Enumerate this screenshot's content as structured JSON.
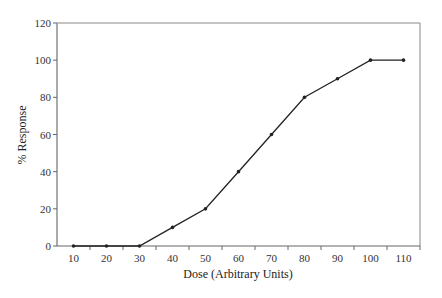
{
  "chart_data": {
    "type": "line",
    "title": "",
    "xlabel": "Dose (Arbitrary Units)",
    "ylabel": "% Response",
    "x": [
      10,
      20,
      30,
      40,
      50,
      60,
      70,
      80,
      90,
      100,
      110
    ],
    "series": [
      {
        "name": "Response",
        "values": [
          0,
          0,
          0,
          10,
          20,
          40,
          60,
          80,
          90,
          100,
          100
        ]
      }
    ],
    "xlim": [
      5,
      115
    ],
    "ylim": [
      0,
      120
    ],
    "xticks": [
      10,
      20,
      30,
      40,
      50,
      60,
      70,
      80,
      90,
      100,
      110
    ],
    "yticks": [
      0,
      20,
      40,
      60,
      80,
      100,
      120
    ],
    "grid": false,
    "legend": null,
    "markers": true,
    "colors": {
      "line": "#222222",
      "axis": "#666666",
      "frame": "#888888"
    }
  }
}
